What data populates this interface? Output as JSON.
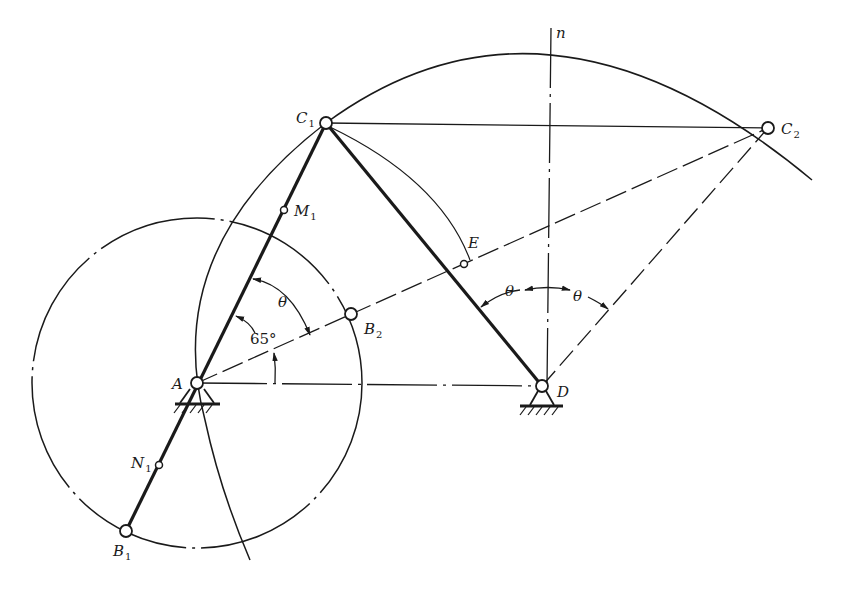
{
  "figure": {
    "caption_mark": "图",
    "colors": {
      "ink": "#1a1a1a",
      "background": "#ffffff",
      "top_rule": "#b8b8b8"
    }
  },
  "points": {
    "A": {
      "label": "A",
      "sub": ""
    },
    "D": {
      "label": "D",
      "sub": ""
    },
    "C1": {
      "label": "C",
      "sub": "1"
    },
    "C2": {
      "label": "C",
      "sub": "2"
    },
    "B1": {
      "label": "B",
      "sub": "1"
    },
    "B2": {
      "label": "B",
      "sub": "2"
    },
    "M1": {
      "label": "M",
      "sub": "1"
    },
    "N1": {
      "label": "N",
      "sub": "1"
    },
    "E": {
      "label": "E",
      "sub": ""
    }
  },
  "axis": {
    "n_label": "n"
  },
  "angles": {
    "theta_at_A": "θ",
    "angle_65": "65°",
    "theta_left_at_D": "θ",
    "theta_right_at_D": "θ"
  }
}
